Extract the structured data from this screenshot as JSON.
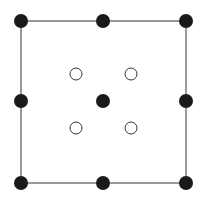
{
  "diagram": {
    "type": "lattice-unit-cell",
    "square": {
      "x1": 21,
      "y1": 21,
      "x2": 186,
      "y2": 183,
      "stroke": "#555555"
    },
    "filled_points": [
      {
        "id": "corner-top-left",
        "cx": 21,
        "cy": 21
      },
      {
        "id": "edge-top-mid",
        "cx": 103,
        "cy": 21
      },
      {
        "id": "corner-top-right",
        "cx": 186,
        "cy": 21
      },
      {
        "id": "edge-left-mid",
        "cx": 21,
        "cy": 101
      },
      {
        "id": "center",
        "cx": 103,
        "cy": 101
      },
      {
        "id": "edge-right-mid",
        "cx": 186,
        "cy": 101
      },
      {
        "id": "corner-bottom-left",
        "cx": 21,
        "cy": 183
      },
      {
        "id": "edge-bottom-mid",
        "cx": 103,
        "cy": 183
      },
      {
        "id": "corner-bottom-right",
        "cx": 186,
        "cy": 183
      }
    ],
    "open_points": [
      {
        "id": "inner-top-left",
        "cx": 76,
        "cy": 74
      },
      {
        "id": "inner-top-right",
        "cx": 131,
        "cy": 74
      },
      {
        "id": "inner-bottom-left",
        "cx": 76,
        "cy": 128
      },
      {
        "id": "inner-bottom-right",
        "cx": 131,
        "cy": 128
      }
    ],
    "colors": {
      "filled": "#1a1a1a",
      "open_stroke": "#333333",
      "open_fill": "#ffffff"
    },
    "filled_radius": 7,
    "open_radius": 6
  }
}
